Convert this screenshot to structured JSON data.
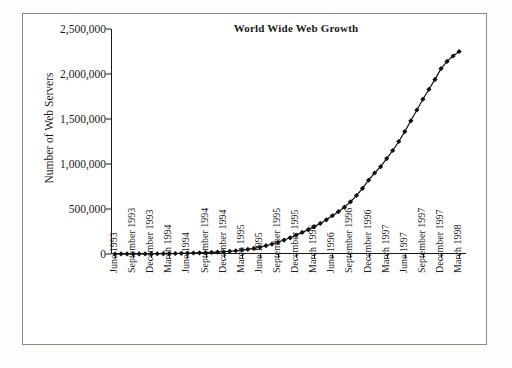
{
  "figure": {
    "title": "World Wide Web Growth",
    "y_axis_label": "Number of Web Servers"
  },
  "chart_data": {
    "type": "line",
    "title": "World Wide Web Growth",
    "xlabel": "",
    "ylabel": "Number of Web Servers",
    "ylim": [
      0,
      2500000
    ],
    "ytick_labels": [
      "2,500,000",
      "2,000,000",
      "1,500,000",
      "1,000,000",
      "500,000",
      "0"
    ],
    "ytick_values": [
      2500000,
      2000000,
      1500000,
      1000000,
      500000,
      0
    ],
    "grid": false,
    "legend": "none",
    "marker": "diamond",
    "line_color": "#111111",
    "marker_color": "#111111",
    "xtick_labels": [
      "June 1993",
      "September 1993",
      "December 1993",
      "March 1994",
      "June 1994",
      "September 1994",
      "December 1994",
      "March 1995",
      "June 1995",
      "September 1995",
      "December 1995",
      "March 1996",
      "June 1996",
      "September 1996",
      "December 1996",
      "March 1997",
      "June 1997",
      "September 1997",
      "December 1997",
      "March 1998"
    ],
    "x": [
      "June 1993",
      "July 1993",
      "August 1993",
      "September 1993",
      "October 1993",
      "November 1993",
      "December 1993",
      "January 1994",
      "February 1994",
      "March 1994",
      "April 1994",
      "May 1994",
      "June 1994",
      "July 1994",
      "August 1994",
      "September 1994",
      "October 1994",
      "November 1994",
      "December 1994",
      "January 1995",
      "February 1995",
      "March 1995",
      "April 1995",
      "May 1995",
      "June 1995",
      "July 1995",
      "August 1995",
      "September 1995",
      "October 1995",
      "November 1995",
      "December 1995",
      "January 1996",
      "February 1996",
      "March 1996",
      "April 1996",
      "May 1996",
      "June 1996",
      "July 1996",
      "August 1996",
      "September 1996",
      "October 1996",
      "November 1996",
      "December 1996",
      "January 1997",
      "February 1997",
      "March 1997",
      "April 1997",
      "May 1997",
      "June 1997",
      "July 1997",
      "August 1997",
      "September 1997",
      "October 1997",
      "November 1997",
      "December 1997",
      "January 1998",
      "February 1998",
      "March 1998"
    ],
    "values": [
      130,
      300,
      550,
      1000,
      1400,
      1800,
      2200,
      2800,
      3500,
      4500,
      5500,
      7000,
      9000,
      11000,
      13000,
      15000,
      18000,
      21000,
      25000,
      30000,
      36000,
      44000,
      52000,
      62000,
      75000,
      92000,
      110000,
      130000,
      155000,
      180000,
      210000,
      240000,
      270000,
      305000,
      340000,
      380000,
      425000,
      470000,
      520000,
      580000,
      650000,
      730000,
      820000,
      900000,
      970000,
      1060000,
      1150000,
      1250000,
      1360000,
      1480000,
      1600000,
      1720000,
      1830000,
      1940000,
      2060000,
      2140000,
      2200000,
      2250000
    ]
  }
}
